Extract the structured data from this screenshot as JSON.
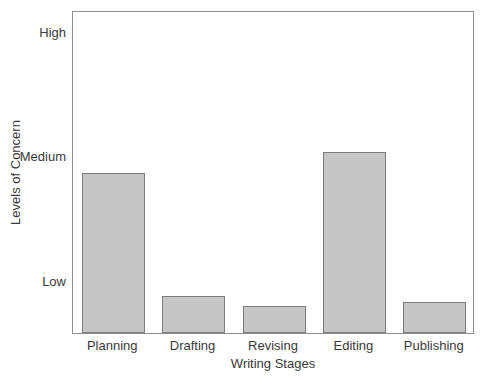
{
  "chart_data": {
    "type": "bar",
    "title": "",
    "xlabel": "Writing Stages",
    "ylabel": "Levels of Concern",
    "categories": [
      "Planning",
      "Drafting",
      "Revising",
      "Editing",
      "Publishing"
    ],
    "values": [
      1.86,
      0.88,
      0.8,
      2.03,
      0.83
    ],
    "ytick_labels": [
      "Low",
      "Medium",
      "High"
    ],
    "ytick_values": [
      1,
      2,
      3
    ],
    "ylim": [
      0.58,
      3.17
    ],
    "grid": false,
    "legend": "none",
    "bar_fill_color": "#c6c6c6",
    "bar_edge_color": "#7c7c7c",
    "axis_color": "#8e8e8e",
    "text_color": "#3a3a3a",
    "background_color": "#ffffff",
    "bars": [
      {
        "category": "Planning",
        "value": 1.86,
        "level": "just below High"
      },
      {
        "category": "Drafting",
        "value": 0.88,
        "level": "below Low"
      },
      {
        "category": "Revising",
        "value": 0.8,
        "level": "below Low"
      },
      {
        "category": "Editing",
        "value": 2.03,
        "level": "at High"
      },
      {
        "category": "Publishing",
        "value": 0.83,
        "level": "below Low"
      }
    ]
  }
}
